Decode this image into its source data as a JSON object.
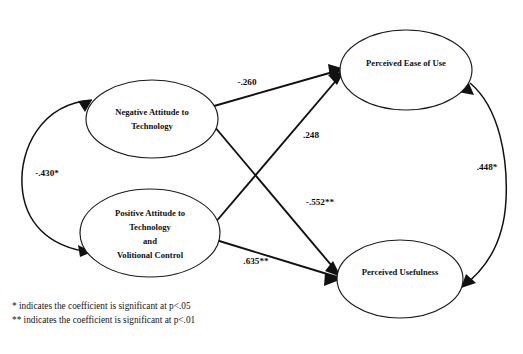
{
  "diagram": {
    "type": "structural-equation-model-path-diagram",
    "nodes": [
      {
        "id": "negative-attitude",
        "lines": [
          "Negative Attitude to",
          "Technology"
        ],
        "cx": 152,
        "cy": 119,
        "rx": 66,
        "ry": 39
      },
      {
        "id": "positive-attitude",
        "lines": [
          "Positive Attitude to",
          "Technology",
          "and",
          "Volitional Control"
        ],
        "cx": 150,
        "cy": 233,
        "rx": 70,
        "ry": 44
      },
      {
        "id": "perceived-ease-of-use",
        "lines": [
          "Perceived Ease of Use"
        ],
        "cx": 406,
        "cy": 70,
        "rx": 66,
        "ry": 40
      },
      {
        "id": "perceived-usefulness",
        "lines": [
          "Perceived Usefulness"
        ],
        "cx": 400,
        "cy": 279,
        "rx": 63,
        "ry": 39
      }
    ],
    "paths": [
      {
        "id": "neg-to-peou",
        "from": "negative-attitude",
        "to": "perceived-ease-of-use",
        "coefficient": "-.260",
        "value": -0.26,
        "significance": "",
        "label_x": 247,
        "label_y": 83
      },
      {
        "id": "pos-to-peou",
        "from": "positive-attitude",
        "to": "perceived-ease-of-use",
        "coefficient": ".248",
        "value": 0.248,
        "significance": "",
        "label_x": 311,
        "label_y": 136
      },
      {
        "id": "neg-to-pu",
        "from": "negative-attitude",
        "to": "perceived-usefulness",
        "coefficient": "-.552**",
        "value": -0.552,
        "significance": "p<.01",
        "label_x": 320,
        "label_y": 203
      },
      {
        "id": "pos-to-pu",
        "from": "positive-attitude",
        "to": "perceived-usefulness",
        "coefficient": ".635**",
        "value": 0.635,
        "significance": "p<.01",
        "label_x": 256,
        "label_y": 262
      }
    ],
    "correlations": [
      {
        "id": "neg-pos-correlation",
        "between": [
          "negative-attitude",
          "positive-attitude"
        ],
        "coefficient": "-.430*",
        "value": -0.43,
        "significance": "p<.05",
        "label_x": 47,
        "label_y": 174
      },
      {
        "id": "peou-pu-correlation",
        "between": [
          "perceived-ease-of-use",
          "perceived-usefulness"
        ],
        "coefficient": ".448*",
        "value": 0.448,
        "significance": "p<.05",
        "label_x": 487,
        "label_y": 168
      }
    ]
  },
  "footnotes": {
    "single_star": "* indicates the coefficient is significant at p<.05",
    "double_star": "** indicates the coefficient is significant at p<.01"
  }
}
